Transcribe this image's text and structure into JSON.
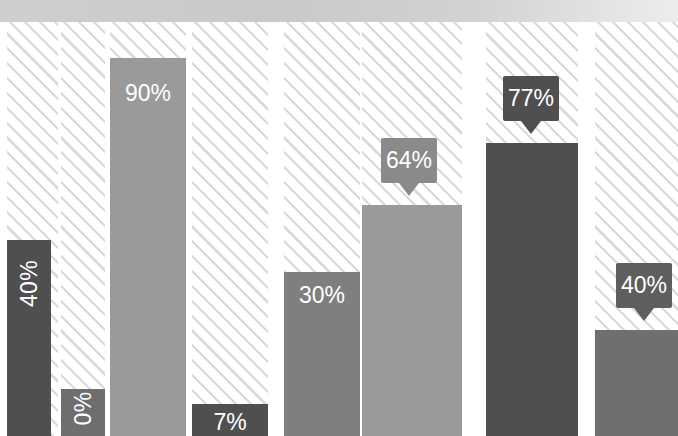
{
  "chart_data": {
    "type": "bar",
    "title": "",
    "subtitle": "",
    "xlabel": "",
    "ylabel": "",
    "ylim": [
      0,
      100
    ],
    "grid": false,
    "legend": false,
    "categories": [
      "1",
      "2",
      "3",
      "4",
      "5",
      "6",
      "7",
      "8"
    ],
    "values": [
      40,
      0,
      90,
      7,
      30,
      64,
      77,
      40
    ],
    "labels": [
      "40%",
      "0%",
      "90%",
      "7%",
      "30%",
      "64%",
      "77%",
      "40%"
    ],
    "series": [
      {
        "name": "Percentage",
        "values": [
          40,
          0,
          90,
          7,
          30,
          64,
          77,
          40
        ]
      }
    ],
    "bar_colors": [
      "#4f4f4f",
      "#6e6e6e",
      "#9a9a9a",
      "#4f4f4f",
      "#7f7f7f",
      "#9a9a9a",
      "#4f4f4f",
      "#6f6f6f"
    ],
    "label_styles": [
      "inside-vertical",
      "inside-vertical",
      "inside-horizontal",
      "inside-horizontal",
      "inside-horizontal",
      "callout",
      "callout",
      "callout"
    ],
    "callout_colors": [
      "",
      "",
      "",
      "",
      "",
      "#8a8a8a",
      "#4f4f4f",
      "#5e5e5e"
    ]
  },
  "bars": [
    {
      "label": "40%",
      "value": 40,
      "color": "#4f4f4f",
      "left": 7,
      "width": 44,
      "top": 240,
      "label_style": "inside-vertical",
      "label_offset": 30
    },
    {
      "label": "0%",
      "value": 0,
      "color": "#6e6e6e",
      "left": 61,
      "width": 44,
      "top": 389,
      "label_style": "inside-vertical",
      "label_offset": 6
    },
    {
      "label": "90%",
      "value": 90,
      "color": "#9a9a9a",
      "left": 110,
      "width": 76,
      "top": 58,
      "label_style": "inside-horizontal",
      "label_offset": 22
    },
    {
      "label": "7%",
      "value": 7,
      "color": "#4f4f4f",
      "left": 192,
      "width": 76,
      "top": 404,
      "label_style": "inside-horizontal",
      "label_offset": 5
    },
    {
      "label": "30%",
      "value": 30,
      "color": "#7f7f7f",
      "left": 284,
      "width": 76,
      "top": 272,
      "label_style": "inside-horizontal",
      "label_offset": 10
    },
    {
      "label": "64%",
      "value": 64,
      "color": "#9a9a9a",
      "left": 362,
      "width": 100,
      "top": 205,
      "label_style": "callout",
      "callout_color": "#8a8a8a",
      "callout_left": 381,
      "callout_top": 138,
      "callout_width": 56,
      "callout_height": 45
    },
    {
      "label": "77%",
      "value": 77,
      "color": "#4f4f4f",
      "left": 486,
      "width": 92,
      "top": 143,
      "label_style": "callout",
      "callout_color": "#4f4f4f",
      "callout_left": 503,
      "callout_top": 76,
      "callout_width": 56,
      "callout_height": 45
    },
    {
      "label": "40%",
      "value": 40,
      "color": "#6f6f6f",
      "left": 595,
      "width": 83,
      "top": 330,
      "label_style": "callout",
      "callout_color": "#5e5e5e",
      "callout_left": 616,
      "callout_top": 263,
      "callout_width": 56,
      "callout_height": 45
    }
  ],
  "hatch_columns": [
    {
      "left": 7,
      "width": 51
    },
    {
      "left": 61,
      "width": 44
    },
    {
      "left": 110,
      "width": 76
    },
    {
      "left": 192,
      "width": 76
    },
    {
      "left": 284,
      "width": 76
    },
    {
      "left": 362,
      "width": 100
    },
    {
      "left": 486,
      "width": 92
    },
    {
      "left": 595,
      "width": 83
    }
  ]
}
